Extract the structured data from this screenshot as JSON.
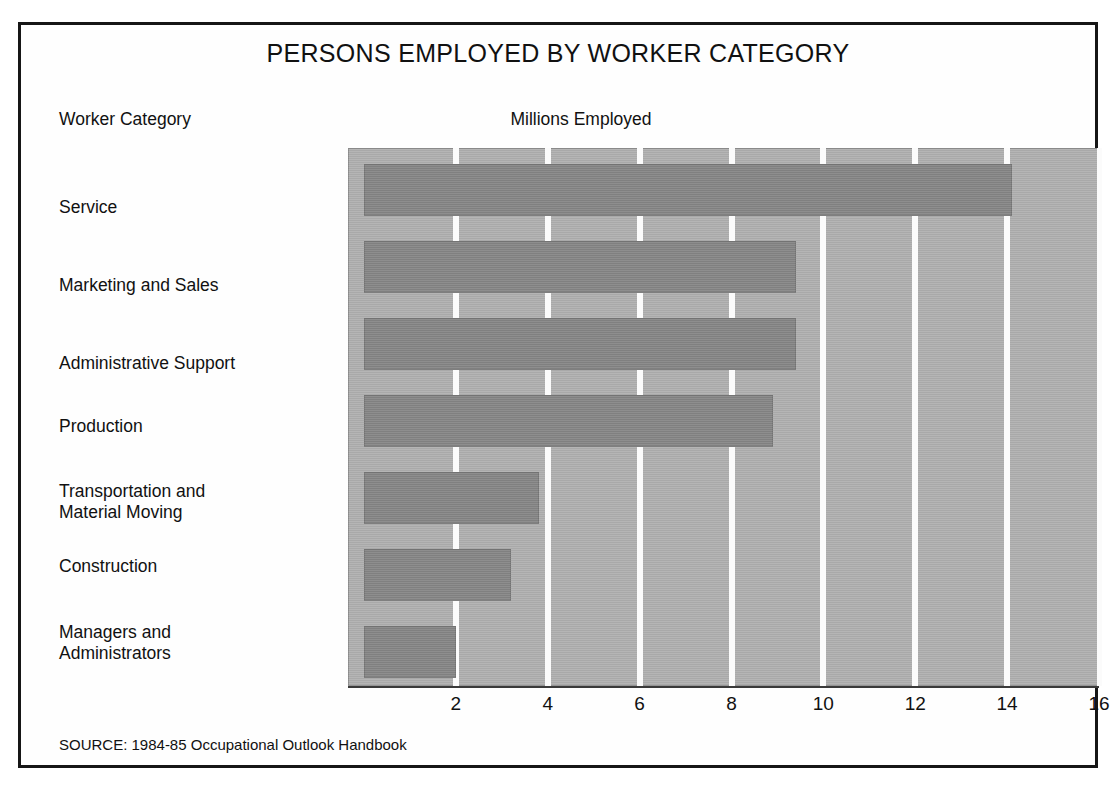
{
  "figure": {
    "title": "PERSONS EMPLOYED BY WORKER CATEGORY",
    "category_header": "Worker Category",
    "value_header": "Millions Employed",
    "source": "SOURCE: 1984-85 Occupational Outlook Handbook",
    "border_color": "#161616",
    "background_color": "#ffffff"
  },
  "chart_data": {
    "type": "bar",
    "orientation": "horizontal",
    "title": "PERSONS EMPLOYED BY WORKER CATEGORY",
    "xlabel": "Millions Employed",
    "ylabel": "Worker Category",
    "categories": [
      "Service",
      "Marketing and Sales",
      "Administrative Support",
      "Production",
      "Transportation and\nMaterial Moving",
      "Construction",
      "Managers and\nAdministrators"
    ],
    "values": [
      14.1,
      9.4,
      9.4,
      8.9,
      3.8,
      3.2,
      2.0
    ],
    "xlim": [
      0,
      16
    ],
    "xticks": [
      2,
      4,
      6,
      8,
      10,
      12,
      14,
      16
    ],
    "xtick_labels": [
      "2",
      "4",
      "6",
      "8",
      "10",
      "12",
      "14",
      "16"
    ],
    "grid": true,
    "grid_color": "#fbfbfb",
    "legend": false,
    "bar_color": "#888888",
    "plot_background_color": "#b2b2b2"
  }
}
